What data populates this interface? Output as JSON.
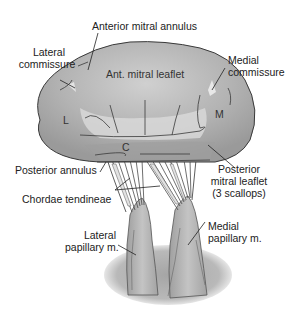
{
  "diagram": {
    "labels": {
      "anterior_annulus": "Anterior mitral annulus",
      "lateral_commissure_1": "Lateral",
      "lateral_commissure_2": "commissure",
      "medial_commissure_1": "Medial",
      "medial_commissure_2": "commissure",
      "ant_leaflet": "Ant. mitral leaflet",
      "L": "L",
      "M": "M",
      "C": "C",
      "posterior_annulus": "Posterior annulus",
      "posterior_leaflet_1": "Posterior",
      "posterior_leaflet_2": "mitral leaflet",
      "posterior_leaflet_3": "(3 scallops)",
      "chordae": "Chordae tendineae",
      "lateral_papillary_1": "Lateral",
      "lateral_papillary_2": "papillary m.",
      "medial_papillary_1": "Medial",
      "medial_papillary_2": "papillary m."
    },
    "colors": {
      "leaflet_fill": "#a9a9a9",
      "leaflet_highlight": "#d4d4d4",
      "outline": "#3a3a3a",
      "muscle_fill": "#b5b5b5",
      "shadow": "#9c9c9c",
      "text": "#222222"
    }
  }
}
